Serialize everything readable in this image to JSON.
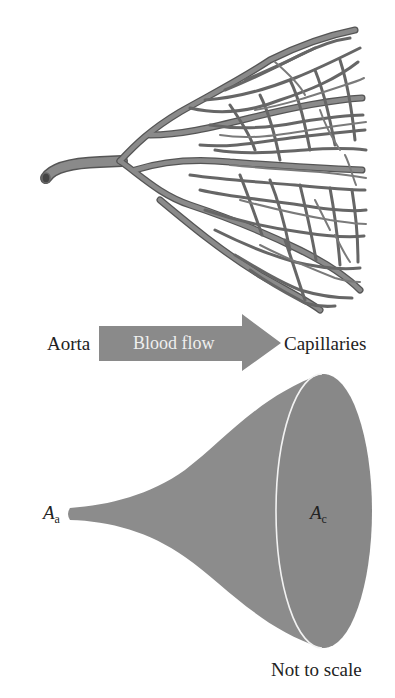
{
  "diagram": {
    "top_illustration": {
      "name": "Branching vessel network from aorta to capillaries",
      "vessel_color": "#7a7a7a",
      "outline_color": "#555555"
    },
    "flow_row": {
      "left_label": "Aorta",
      "arrow_label": "Blood flow",
      "right_label": "Capillaries",
      "arrow_color": "#8a8a8a",
      "arrow_text_color": "#efefef"
    },
    "funnel": {
      "fill_color": "#8c8c8c",
      "rim_highlight_color": "#f2f2f2",
      "small_end_label": {
        "symbol": "A",
        "subscript": "a"
      },
      "large_end_label": {
        "symbol": "A",
        "subscript": "c"
      }
    },
    "note": "Not to scale"
  }
}
